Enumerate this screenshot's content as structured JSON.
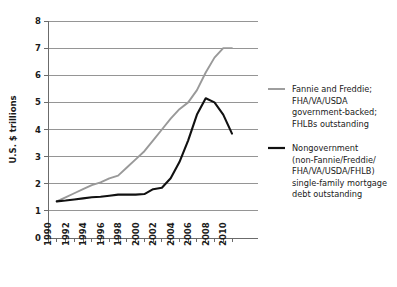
{
  "chart_data": {
    "type": "line",
    "title": "",
    "xlabel": "",
    "ylabel": "U.S. $ trillions",
    "xlim": [
      1990,
      2011
    ],
    "ylim": [
      0,
      8
    ],
    "yticks": [
      0,
      1,
      2,
      3,
      4,
      5,
      6,
      7,
      8
    ],
    "ytick_labels": [
      "0",
      "1",
      "2",
      "3",
      "4",
      "5",
      "6",
      "7",
      "8"
    ],
    "xticks": [
      1990,
      1991,
      1992,
      1993,
      1994,
      1995,
      1996,
      1997,
      1998,
      1999,
      2000,
      2001,
      2002,
      2003,
      2004,
      2005,
      2006,
      2007,
      2008,
      2009,
      2010,
      2011
    ],
    "xtick_labels": [
      "1990",
      "",
      "1992",
      "",
      "1994",
      "",
      "1996",
      "",
      "1998",
      "",
      "2000",
      "",
      "2002",
      "",
      "2004",
      "",
      "2006",
      "",
      "2008",
      "",
      "2010",
      ""
    ],
    "grid": "horizontal",
    "legend_position": "right",
    "x": [
      1991,
      1992,
      1993,
      1994,
      1995,
      1996,
      1997,
      1998,
      1999,
      2000,
      2001,
      2002,
      2003,
      2004,
      2005,
      2006,
      2007,
      2008,
      2009,
      2010,
      2011
    ],
    "series": [
      {
        "name": "Fannie and Freddie; FHA/VA/USDA government-backed; FHLBs outstanding",
        "color": "#999999",
        "values": [
          1.35,
          1.5,
          1.65,
          1.8,
          1.95,
          2.05,
          2.2,
          2.3,
          2.6,
          2.9,
          3.2,
          3.6,
          4.0,
          4.4,
          4.75,
          5.0,
          5.45,
          6.1,
          6.65,
          7.0,
          7.0
        ]
      },
      {
        "name": "Nongovernment (non-Fannie/Freddie/FHA/VA/USDA/FHLB) single-family mortgage debt outstanding",
        "color": "#111111",
        "values": [
          1.35,
          1.38,
          1.42,
          1.46,
          1.5,
          1.52,
          1.56,
          1.6,
          1.6,
          1.6,
          1.62,
          1.8,
          1.85,
          2.2,
          2.8,
          3.6,
          4.55,
          5.15,
          5.0,
          4.55,
          3.85
        ]
      }
    ]
  },
  "legend": {
    "items": [
      {
        "color": "#999999",
        "lines": [
          "Fannie and Freddie;",
          "FHA/VA/USDA",
          "government-backed;",
          "FHLBs outstanding"
        ]
      },
      {
        "color": "#111111",
        "lines": [
          "Nongovernment",
          "(non-Fannie/Freddie/",
          "FHA/VA/USDA/FHLB)",
          "single-family mortgage",
          "debt outstanding"
        ]
      }
    ]
  }
}
